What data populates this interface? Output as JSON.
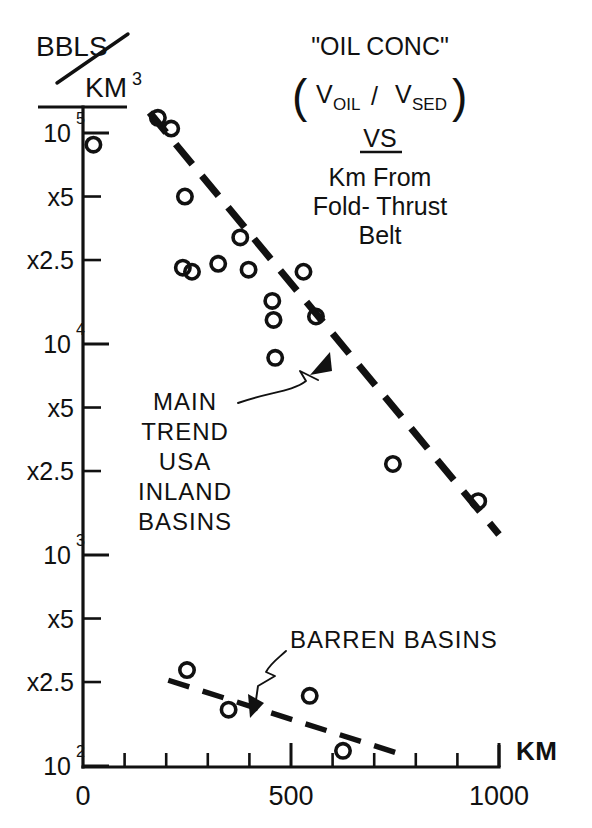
{
  "figure": {
    "y_axis_unit_top": "BBLS",
    "y_axis_unit_bottom": "KM",
    "y_axis_unit_bottom_sup": "3",
    "x_axis_unit": "KM"
  },
  "title_block": {
    "line1": "\"OIL CONC\"",
    "line2_v1": "V",
    "line2_v1_sub": "OIL",
    "line2_slash": "/",
    "line2_v2": "V",
    "line2_v2_sub": "SED",
    "line3": "VS",
    "line4": "Km  From",
    "line5": "Fold- Thrust",
    "line6": "Belt"
  },
  "annotations": [
    {
      "name": "main-trend",
      "lines": [
        "MAIN",
        "TREND",
        "USA",
        "INLAND",
        "BASINS"
      ]
    },
    {
      "name": "barren-basins",
      "lines": [
        "BARREN BASINS"
      ]
    }
  ],
  "chart_data": {
    "type": "scatter",
    "xlabel": "KM",
    "ylabel": "BBLS / KM^3",
    "xlim": [
      0,
      1000
    ],
    "ylim": [
      100,
      100000
    ],
    "yscale": "log",
    "grid": false,
    "legend": false,
    "xticks": [
      0,
      100,
      200,
      300,
      400,
      500,
      600,
      700,
      800,
      900,
      1000
    ],
    "xtick_labels": [
      "0",
      "",
      "",
      "",
      "",
      "500",
      "",
      "",
      "",
      "",
      "1000"
    ],
    "yticks": [
      100000,
      50000,
      25000,
      10000,
      5000,
      2500,
      1000,
      500,
      250,
      100
    ],
    "ytick_labels": [
      "10^5",
      "x5",
      "x2.5",
      "10^4",
      "x5",
      "x2.5",
      "10^3",
      "x5",
      "x2.5",
      "10^2"
    ],
    "ytick_bases": [
      "10",
      "x5",
      "x2.5",
      "10",
      "x5",
      "x2.5",
      "10",
      "x5",
      "x2.5",
      "10"
    ],
    "ytick_exponents": [
      "5",
      "",
      "",
      "4",
      "",
      "",
      "3",
      "",
      "",
      "2"
    ],
    "series": [
      {
        "name": "USA inland basins",
        "marker": "open-circle",
        "points": [
          {
            "x": 25,
            "y": 88000
          },
          {
            "x": 180,
            "y": 118000
          },
          {
            "x": 212,
            "y": 105000
          },
          {
            "x": 245,
            "y": 50000
          },
          {
            "x": 240,
            "y": 23000
          },
          {
            "x": 262,
            "y": 22000
          },
          {
            "x": 325,
            "y": 24000
          },
          {
            "x": 378,
            "y": 32000
          },
          {
            "x": 398,
            "y": 22500
          },
          {
            "x": 455,
            "y": 16000
          },
          {
            "x": 458,
            "y": 13000
          },
          {
            "x": 462,
            "y": 8600
          },
          {
            "x": 530,
            "y": 22000
          },
          {
            "x": 560,
            "y": 13500
          },
          {
            "x": 745,
            "y": 2700
          },
          {
            "x": 950,
            "y": 1800
          }
        ]
      },
      {
        "name": "Barren basins",
        "marker": "open-circle",
        "points": [
          {
            "x": 250,
            "y": 285
          },
          {
            "x": 350,
            "y": 185
          },
          {
            "x": 545,
            "y": 215
          },
          {
            "x": 625,
            "y": 118
          }
        ]
      }
    ],
    "trendlines": [
      {
        "name": "main-trend-usa-inland-basins",
        "style": "dashed",
        "x_start": 160,
        "y_start": 125000,
        "x_end": 1000,
        "y_end": 1250
      },
      {
        "name": "barren-basins-trend",
        "style": "dashed",
        "x_start": 205,
        "y_start": 255,
        "x_end": 775,
        "y_end": 112
      }
    ]
  }
}
